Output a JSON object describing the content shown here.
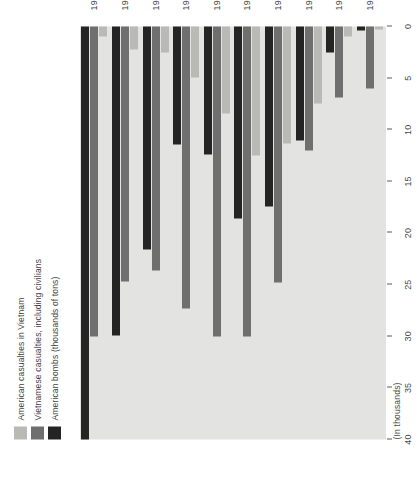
{
  "chart_data": {
    "type": "bar",
    "orientation": "horizontal",
    "title": "",
    "subtitle": "",
    "unit_caption": "(In thousands)",
    "xlabel": "",
    "ylabel": "",
    "xlim": [
      0,
      40
    ],
    "x_ticks": [
      40,
      35,
      30,
      25,
      20,
      15,
      10,
      5,
      0
    ],
    "x_tick_labels": [
      "40",
      "35",
      "30",
      "25",
      "20",
      "15",
      "10",
      "5",
      "0"
    ],
    "x_axis_reversed": true,
    "grid": false,
    "legend_position": "right",
    "categories": [
      "1972",
      "1971",
      "1970",
      "1969",
      "1968",
      "1967",
      "1966",
      "1965",
      "1964",
      "1963"
    ],
    "series": [
      {
        "name": "American casualties in Vietnam",
        "color": "#b9b9b6",
        "values": [
          1.0,
          2.2,
          2.5,
          4.9,
          8.4,
          12.5,
          11.3,
          7.5,
          1.0,
          0.3
        ]
      },
      {
        "name": "Vietnamese casualties, including civilians",
        "color": "#6f6f6f",
        "values": [
          30.0,
          24.7,
          23.6,
          27.3,
          30.0,
          30.0,
          24.8,
          12.0,
          6.9,
          6.0
        ]
      },
      {
        "name": "American bombs (thousands of tons)",
        "color": "#242424",
        "values": [
          40.0,
          29.9,
          21.6,
          11.4,
          12.4,
          18.6,
          17.4,
          11.0,
          2.5,
          0.4
        ]
      }
    ]
  },
  "legend": {
    "items": [
      {
        "label": "American casualties in Vietnam",
        "color": "#b9b9b6"
      },
      {
        "label": "Vietnamese casualties, including civilians",
        "color": "#6f6f6f"
      },
      {
        "label": "American bombs (thousands of tons)",
        "color": "#242424"
      }
    ]
  },
  "colors": {
    "panel_background": "#e3e3e1",
    "page_background": "#ffffff",
    "axis": "#5b5b5b",
    "text": "#3f3f3f"
  }
}
